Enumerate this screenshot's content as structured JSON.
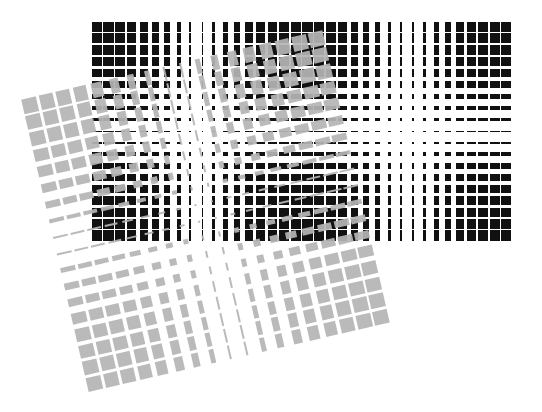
{
  "title": "Moiré grid pattern",
  "background": "#ffffff",
  "grids": [
    {
      "name": "black-grid",
      "color": "#111111",
      "left": 91,
      "top": 21,
      "cols": 36,
      "rows": 19,
      "pitch_x": 11.7,
      "pitch_y": 11.6,
      "col_periods": 2,
      "row_periods": 1,
      "min_fraction": 0.06,
      "max_fraction": 0.88,
      "rotation_deg": 0,
      "opacity": 1
    },
    {
      "name": "gray-grid",
      "color": "#b5b5b5",
      "left": 50,
      "top": 60,
      "cols": 18,
      "rows": 18,
      "pitch_x": 17.3,
      "pitch_y": 16.8,
      "col_periods": 1,
      "row_periods": 1,
      "min_fraction": 0.05,
      "max_fraction": 0.85,
      "rotation_deg": -13,
      "opacity": 0.92
    }
  ]
}
